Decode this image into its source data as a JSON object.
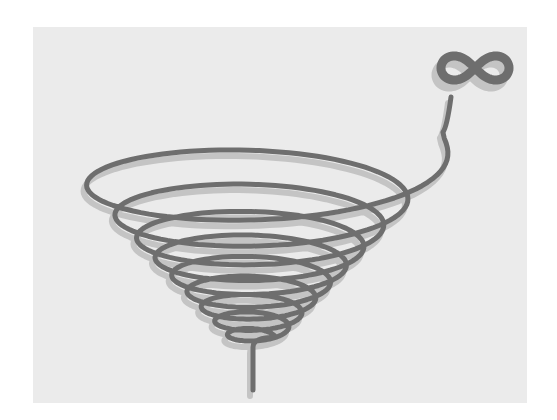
{
  "illustration": {
    "subject": "inverted conical spiral ending in an infinity symbol",
    "symbol": "∞",
    "symbol_name": "infinity-icon",
    "colors": {
      "page_background": "#ffffff",
      "panel_background": "#ebebeb",
      "stroke": "#6e6e6e",
      "shadow": "#c4c4c4"
    },
    "spiral": {
      "turns": 9,
      "top_center": [
        255,
        150
      ],
      "bottom_center": [
        255,
        340
      ],
      "top_radius_x": 200,
      "bottom_radius_x": 22,
      "top_radius_y": 52,
      "bottom_radius_y": 8,
      "stroke_width": 5,
      "stem_end": [
        253,
        390
      ]
    },
    "infinity": {
      "center": [
        475,
        68
      ],
      "width": 68,
      "height": 34
    }
  }
}
